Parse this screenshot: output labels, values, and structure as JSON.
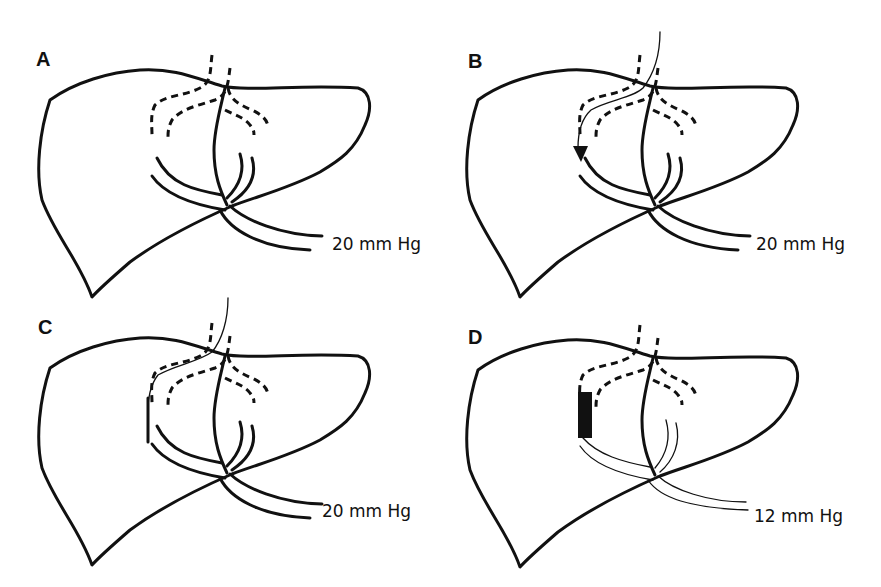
{
  "figure": {
    "panels": [
      {
        "id": "A",
        "label": "A",
        "pressure": "20 mm Hg",
        "guidewire": false,
        "arrow": false,
        "shunt_bypass": false,
        "stent": false
      },
      {
        "id": "B",
        "label": "B",
        "pressure": "20 mm Hg",
        "guidewire": true,
        "arrow": true,
        "shunt_bypass": false,
        "stent": false
      },
      {
        "id": "C",
        "label": "C",
        "pressure": "20 mm Hg",
        "guidewire": true,
        "arrow": false,
        "shunt_bypass": true,
        "stent": false
      },
      {
        "id": "D",
        "label": "D",
        "pressure": "12 mm Hg",
        "guidewire": false,
        "arrow": false,
        "shunt_bypass": true,
        "stent": true
      }
    ],
    "colors": {
      "stroke": "#111111",
      "background": "#ffffff"
    }
  }
}
